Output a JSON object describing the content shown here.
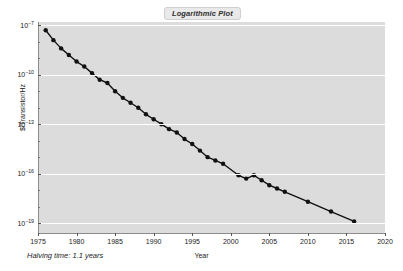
{
  "chart_data": {
    "type": "line",
    "title": "Logarithmic Plot",
    "xlabel": "Year",
    "ylabel": "$/Transistor/Hz",
    "annotation": "Halving time: 1.1 years",
    "xlim": [
      1975,
      2020
    ],
    "ylim_exponent": [
      -19.6,
      -6.8
    ],
    "grid": true,
    "legend": false,
    "y_scale": "log",
    "xticks": [
      1975,
      1980,
      1985,
      1990,
      1995,
      2000,
      2005,
      2010,
      2015,
      2020
    ],
    "xtick_labels": [
      "1975",
      "1980",
      "1985",
      "1990",
      "1995",
      "2000",
      "2005",
      "2010",
      "2015",
      "2020"
    ],
    "yticks_exponent": [
      -7,
      -10,
      -13,
      -16,
      -19
    ],
    "ytick_labels": [
      "10−7",
      "10−10",
      "10−13",
      "10−16",
      "10−19"
    ],
    "ytick_mantissa": "10",
    "ytick_exponents": [
      "-7",
      "-10",
      "-13",
      "-16",
      "-19"
    ],
    "series": [
      {
        "name": "$/Transistor/Hz",
        "marker": "circle",
        "color": "#111111",
        "x": [
          1976,
          1977,
          1978,
          1979,
          1980,
          1981,
          1982,
          1983,
          1984,
          1985,
          1986,
          1987,
          1988,
          1989,
          1990,
          1991,
          1992,
          1993,
          1994,
          1995,
          1996,
          1997,
          1998,
          1999,
          2001,
          2002,
          2003,
          2004,
          2005,
          2006,
          2007,
          2010,
          2013,
          2016
        ],
        "y_exponent": [
          -7.3,
          -7.9,
          -8.4,
          -8.8,
          -9.2,
          -9.5,
          -9.9,
          -10.3,
          -10.5,
          -11.0,
          -11.4,
          -11.7,
          -12.0,
          -12.4,
          -12.7,
          -13.0,
          -13.3,
          -13.5,
          -13.9,
          -14.2,
          -14.6,
          -15.0,
          -15.2,
          -15.4,
          -16.1,
          -16.3,
          -16.1,
          -16.4,
          -16.7,
          -16.9,
          -17.1,
          -17.7,
          -18.3,
          -18.9
        ]
      }
    ],
    "colors": {
      "plot_background": "#dcdcdc",
      "figure_background": "#ffffff",
      "gridline": "#ffffff",
      "line": "#111111",
      "marker": "#111111",
      "axis": "#8c8c8c",
      "title_box_background": "#e9e9e9",
      "text": "#1a1a1a"
    }
  }
}
